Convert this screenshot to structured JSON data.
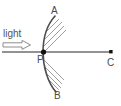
{
  "diagram": {
    "labels": {
      "light": "light",
      "top_edge": "A",
      "bottom_edge": "B",
      "center_of_curvature": "C",
      "pole": "P"
    },
    "colors": {
      "line": "#6e6e6e",
      "mirror": "#555555",
      "hatch": "#9a9a9a",
      "text": "#4a4a4a",
      "point": "#111111",
      "arrow_outline": "#8d8d8d",
      "arrow_fill": "#ffffff",
      "background": "#ffffff"
    },
    "geometry": {
      "principal_axis": {
        "x1": 2,
        "y1": 52,
        "x2": 112,
        "y2": 52
      },
      "pole_point": {
        "x": 44,
        "y": 52
      },
      "center_point": {
        "x": 111,
        "y": 52
      },
      "mirror_arc": {
        "top": {
          "x": 55,
          "y": 16
        },
        "vertex": {
          "x": 43,
          "y": 52
        },
        "bottom": {
          "x": 56,
          "y": 92
        }
      },
      "light_arrow": {
        "x": 3,
        "y": 41,
        "width": 28,
        "height": 8,
        "direction": "right"
      }
    }
  }
}
